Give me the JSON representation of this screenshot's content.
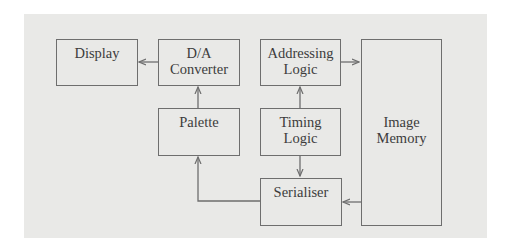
{
  "diagram": {
    "type": "block-diagram",
    "colors": {
      "background": "#e9e9e7",
      "stroke": "#6e6e6e",
      "text": "#3c3c3c"
    },
    "blocks": [
      {
        "id": "display",
        "label": "Display"
      },
      {
        "id": "da_converter",
        "label_line1": "D/A",
        "label_line2": "Converter"
      },
      {
        "id": "palette",
        "label": "Palette"
      },
      {
        "id": "addressing_logic",
        "label_line1": "Addressing",
        "label_line2": "Logic"
      },
      {
        "id": "timing_logic",
        "label_line1": "Timing",
        "label_line2": "Logic"
      },
      {
        "id": "serialiser",
        "label": "Serialiser"
      },
      {
        "id": "image_memory",
        "label_line1": "Image",
        "label_line2": "Memory"
      }
    ],
    "edges": [
      {
        "from": "da_converter",
        "to": "display"
      },
      {
        "from": "palette",
        "to": "da_converter"
      },
      {
        "from": "timing_logic",
        "to": "addressing_logic"
      },
      {
        "from": "addressing_logic",
        "to": "image_memory"
      },
      {
        "from": "timing_logic",
        "to": "serialiser"
      },
      {
        "from": "image_memory",
        "to": "serialiser"
      },
      {
        "from": "serialiser",
        "to": "palette"
      }
    ]
  }
}
